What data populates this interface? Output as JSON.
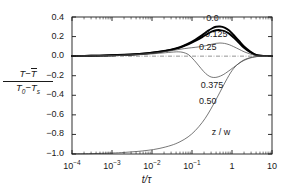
{
  "chart_data": {
    "type": "line",
    "title": "",
    "xlabel": "t/τ",
    "ylabel": "(T − T̄) / (T₀ − Tₛ)",
    "xscale": "log",
    "xlim": [
      0.0001,
      10
    ],
    "ylim": [
      -1.0,
      0.4
    ],
    "xticks": [
      0.0001,
      0.001,
      0.01,
      0.1,
      1,
      10
    ],
    "xtick_labels": [
      "10⁻⁴",
      "10⁻³",
      "10⁻²",
      "10⁻¹",
      "1",
      "10"
    ],
    "yticks": [
      0.4,
      0.2,
      0.0,
      -0.2,
      -0.4,
      -0.6,
      -0.8,
      -1.0
    ],
    "ytick_labels": [
      "0.4",
      "0.2",
      "0.0",
      "−0.2",
      "−0.4",
      "−0.6",
      "−0.8",
      "−1.0"
    ],
    "grid": false,
    "legend": "inline-curve-labels",
    "zero_reference_line": true,
    "zero_reference_style": "dash-dot",
    "parameter_name": "z / w",
    "series": [
      {
        "name": "0.0",
        "label": "0.0",
        "linewidth": "thick",
        "color": "#000000",
        "points": [
          [
            0.0001,
            0.002
          ],
          [
            0.0003,
            0.004
          ],
          [
            0.001,
            0.009
          ],
          [
            0.002,
            0.014
          ],
          [
            0.004,
            0.021
          ],
          [
            0.008,
            0.031
          ],
          [
            0.015,
            0.045
          ],
          [
            0.03,
            0.067
          ],
          [
            0.05,
            0.092
          ],
          [
            0.08,
            0.128
          ],
          [
            0.12,
            0.168
          ],
          [
            0.18,
            0.215
          ],
          [
            0.25,
            0.258
          ],
          [
            0.32,
            0.285
          ],
          [
            0.4,
            0.3
          ],
          [
            0.5,
            0.303
          ],
          [
            0.65,
            0.292
          ],
          [
            0.85,
            0.262
          ],
          [
            1.1,
            0.216
          ],
          [
            1.5,
            0.155
          ],
          [
            2.0,
            0.098
          ],
          [
            2.8,
            0.05
          ],
          [
            3.6,
            0.022
          ],
          [
            4.5,
            0.008
          ],
          [
            6.0,
            0.002
          ],
          [
            10,
            0.0
          ]
        ]
      },
      {
        "name": "0.125",
        "label": "0.125",
        "linewidth": "thick",
        "color": "#000000",
        "points": [
          [
            0.0001,
            0.002
          ],
          [
            0.0003,
            0.004
          ],
          [
            0.001,
            0.009
          ],
          [
            0.002,
            0.013
          ],
          [
            0.004,
            0.02
          ],
          [
            0.008,
            0.03
          ],
          [
            0.015,
            0.043
          ],
          [
            0.03,
            0.064
          ],
          [
            0.05,
            0.088
          ],
          [
            0.08,
            0.12
          ],
          [
            0.12,
            0.155
          ],
          [
            0.18,
            0.195
          ],
          [
            0.25,
            0.23
          ],
          [
            0.32,
            0.252
          ],
          [
            0.4,
            0.264
          ],
          [
            0.5,
            0.266
          ],
          [
            0.65,
            0.256
          ],
          [
            0.85,
            0.23
          ],
          [
            1.1,
            0.19
          ],
          [
            1.5,
            0.136
          ],
          [
            2.0,
            0.086
          ],
          [
            2.8,
            0.043
          ],
          [
            3.6,
            0.019
          ],
          [
            4.5,
            0.007
          ],
          [
            6.0,
            0.002
          ],
          [
            10,
            0.0
          ]
        ]
      },
      {
        "name": "0.25",
        "label": "0.25",
        "linewidth": "thin",
        "color": "#4a4a4a",
        "points": [
          [
            0.0001,
            0.002
          ],
          [
            0.0003,
            0.003
          ],
          [
            0.001,
            0.007
          ],
          [
            0.002,
            0.011
          ],
          [
            0.004,
            0.017
          ],
          [
            0.008,
            0.026
          ],
          [
            0.015,
            0.038
          ],
          [
            0.03,
            0.055
          ],
          [
            0.05,
            0.07
          ],
          [
            0.08,
            0.082
          ],
          [
            0.12,
            0.09
          ],
          [
            0.18,
            0.1
          ],
          [
            0.25,
            0.112
          ],
          [
            0.32,
            0.123
          ],
          [
            0.4,
            0.131
          ],
          [
            0.5,
            0.134
          ],
          [
            0.65,
            0.13
          ],
          [
            0.85,
            0.117
          ],
          [
            1.1,
            0.097
          ],
          [
            1.5,
            0.07
          ],
          [
            2.0,
            0.045
          ],
          [
            2.8,
            0.023
          ],
          [
            3.6,
            0.01
          ],
          [
            4.5,
            0.004
          ],
          [
            6.0,
            0.001
          ],
          [
            10,
            0.0
          ]
        ]
      },
      {
        "name": "0.375",
        "label": "0.375",
        "linewidth": "thin",
        "color": "#4a4a4a",
        "points": [
          [
            0.0001,
            0.001
          ],
          [
            0.0003,
            0.002
          ],
          [
            0.001,
            0.005
          ],
          [
            0.002,
            0.008
          ],
          [
            0.004,
            0.013
          ],
          [
            0.008,
            0.02
          ],
          [
            0.015,
            0.029
          ],
          [
            0.03,
            0.04
          ],
          [
            0.045,
            0.044
          ],
          [
            0.06,
            0.038
          ],
          [
            0.08,
            0.018
          ],
          [
            0.1,
            -0.018
          ],
          [
            0.13,
            -0.07
          ],
          [
            0.17,
            -0.128
          ],
          [
            0.22,
            -0.178
          ],
          [
            0.28,
            -0.208
          ],
          [
            0.35,
            -0.218
          ],
          [
            0.45,
            -0.212
          ],
          [
            0.6,
            -0.19
          ],
          [
            0.8,
            -0.156
          ],
          [
            1.1,
            -0.114
          ],
          [
            1.5,
            -0.074
          ],
          [
            2.0,
            -0.043
          ],
          [
            2.8,
            -0.02
          ],
          [
            3.6,
            -0.009
          ],
          [
            4.5,
            -0.003
          ],
          [
            6.0,
            -0.001
          ],
          [
            10,
            0.0
          ]
        ]
      },
      {
        "name": "0.50",
        "label": "0.50",
        "linewidth": "thin",
        "color": "#4a4a4a",
        "points": [
          [
            0.0001,
            -0.998
          ],
          [
            0.0003,
            -0.996
          ],
          [
            0.001,
            -0.99
          ],
          [
            0.002,
            -0.984
          ],
          [
            0.004,
            -0.975
          ],
          [
            0.008,
            -0.962
          ],
          [
            0.015,
            -0.944
          ],
          [
            0.03,
            -0.912
          ],
          [
            0.05,
            -0.875
          ],
          [
            0.08,
            -0.825
          ],
          [
            0.12,
            -0.762
          ],
          [
            0.18,
            -0.678
          ],
          [
            0.25,
            -0.592
          ],
          [
            0.35,
            -0.487
          ],
          [
            0.5,
            -0.368
          ],
          [
            0.7,
            -0.254
          ],
          [
            1.0,
            -0.148
          ],
          [
            1.4,
            -0.082
          ],
          [
            2.0,
            -0.038
          ],
          [
            2.8,
            -0.016
          ],
          [
            3.6,
            -0.007
          ],
          [
            4.5,
            -0.003
          ],
          [
            6.0,
            -0.001
          ],
          [
            10,
            0.0
          ]
        ]
      }
    ],
    "annotations": [
      {
        "text": "0.0",
        "x": 0.45,
        "y": 0.375,
        "name": "curve-label-0-0"
      },
      {
        "text": "0.125",
        "x": 0.42,
        "y": 0.215,
        "name": "curve-label-0-125"
      },
      {
        "text": "0.25",
        "x": 0.3,
        "y": 0.083,
        "name": "curve-label-0-25"
      },
      {
        "text": "0.375",
        "x": 0.33,
        "y": -0.31,
        "name": "curve-label-0-375"
      },
      {
        "text": "0.50",
        "x": 0.3,
        "y": -0.47,
        "name": "curve-label-0-50"
      },
      {
        "text": "z / w",
        "x": 0.62,
        "y": -0.79,
        "name": "curve-label-z-over-w"
      }
    ]
  },
  "axes": {
    "x_tick_labels": [
      {
        "base": "10",
        "exp": "−4"
      },
      {
        "base": "10",
        "exp": "−3"
      },
      {
        "base": "10",
        "exp": "−2"
      },
      {
        "base": "10",
        "exp": "−1"
      },
      {
        "base": "1",
        "exp": ""
      },
      {
        "base": "10",
        "exp": ""
      }
    ],
    "y_tick_labels": [
      "0.4",
      "0.2",
      "0.0",
      "−0.2",
      "−0.4",
      "−0.6",
      "−0.8",
      "−1.0"
    ],
    "x_axis_title": "t/τ",
    "y_axis_numerator_a": "T",
    "y_axis_numerator_minus": "−",
    "y_axis_numerator_b": "T",
    "y_axis_denominator_a": "T",
    "y_axis_denominator_a_sub": "0",
    "y_axis_denominator_minus": "−",
    "y_axis_denominator_b": "T",
    "y_axis_denominator_b_sub": "s"
  },
  "colors": {
    "axis": "#1a1a1a",
    "curve_thick": "#000000",
    "curve_thin": "#4a4a4a",
    "zero_line": "#666666",
    "background": "#ffffff"
  }
}
